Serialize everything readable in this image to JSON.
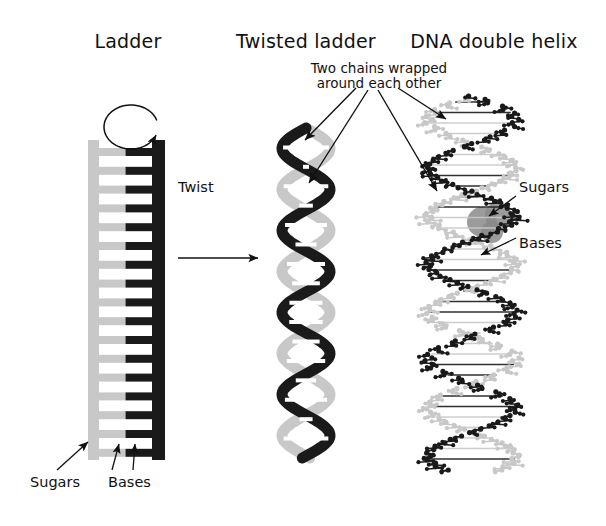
{
  "figure": {
    "width": 606,
    "height": 526,
    "background": "#ffffff",
    "ink": "#111111"
  },
  "colors": {
    "strand_light": "#c8c8c8",
    "strand_dark": "#1a1a1a",
    "highlight_blob": "#8a8a8a",
    "arrow": "#111111",
    "background": "#ffffff"
  },
  "panels": [
    {
      "id": "ladder",
      "title": "Ladder",
      "title_x": 128,
      "title_y": 44
    },
    {
      "id": "twisted-ladder",
      "title": "Twisted ladder",
      "title_x": 306,
      "title_y": 44
    },
    {
      "id": "dna-double-helix",
      "title": "DNA double helix",
      "title_x": 494,
      "title_y": 44
    }
  ],
  "annotations": {
    "two_chains": {
      "line1": "Two chains wrapped",
      "line2": "around each other",
      "x": 379,
      "y": 68
    },
    "twist": {
      "label": "Twist",
      "x": 198,
      "y": 186
    },
    "model_sugars": {
      "label": "Sugars",
      "x": 521,
      "y": 186
    },
    "model_bases": {
      "label": "Bases",
      "x": 521,
      "y": 242
    },
    "ladder_sugars": {
      "label": "Sugars",
      "x": 32,
      "y": 481
    },
    "ladder_bases": {
      "label": "Bases",
      "x": 110,
      "y": 481
    }
  },
  "ladder": {
    "left_rail_x": 88,
    "right_rail_x": 152,
    "rail_width": 11,
    "rail_top": 140,
    "rail_bottom": 460,
    "rung_count": 17,
    "rung_first_y": 148,
    "rung_pitch": 18.8,
    "rung_thickness": 8,
    "rotation_arrow": {
      "cx": 131,
      "cy": 127,
      "rx": 27,
      "ry": 22,
      "direction": "counterclockwise"
    }
  },
  "twisted_ladder": {
    "cx": 306,
    "top": 128,
    "bottom": 458,
    "amplitude": 24,
    "period": 82,
    "ribbon_width": 11,
    "rung_count": 16
  },
  "molecular_model": {
    "cx": 472,
    "top": 96,
    "bottom": 470,
    "amplitude": 44,
    "period": 96,
    "atom_radius": 2.6,
    "highlight_blobs": [
      {
        "cx": 482,
        "cy": 222,
        "r": 15
      },
      {
        "cx": 498,
        "cy": 215,
        "r": 13
      },
      {
        "cx": 492,
        "cy": 232,
        "r": 11
      }
    ]
  },
  "arrows": {
    "twist_arrow": {
      "x1": 178,
      "y1": 258,
      "x2": 258,
      "y2": 258
    },
    "fan": [
      {
        "x1": 356,
        "y1": 88,
        "x2": 305,
        "y2": 140
      },
      {
        "x1": 368,
        "y1": 90,
        "x2": 309,
        "y2": 183
      },
      {
        "x1": 398,
        "y1": 88,
        "x2": 446,
        "y2": 119
      },
      {
        "x1": 378,
        "y1": 90,
        "x2": 437,
        "y2": 191
      }
    ],
    "model_sugars_arrow": {
      "x1": 516,
      "y1": 196,
      "x2": 489,
      "y2": 216
    },
    "model_bases_arrow": {
      "x1": 516,
      "y1": 238,
      "x2": 481,
      "y2": 255
    },
    "ladder_sugars_arrow": {
      "x1": 57,
      "y1": 470,
      "x2": 88,
      "y2": 442
    },
    "ladder_bases_arrows": [
      {
        "x1": 112,
        "y1": 470,
        "x2": 119,
        "y2": 444
      },
      {
        "x1": 133,
        "y1": 470,
        "x2": 135,
        "y2": 444
      }
    ]
  }
}
